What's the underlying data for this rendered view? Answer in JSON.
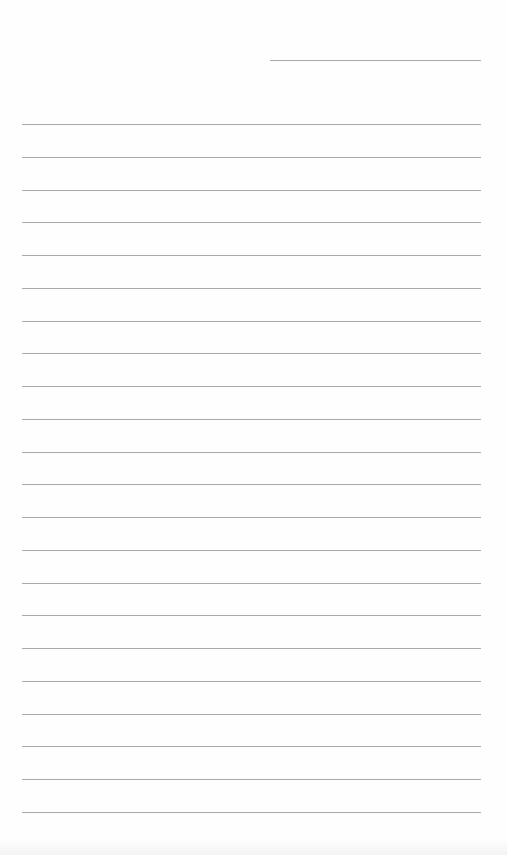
{
  "document": {
    "type": "lined-paper",
    "background_color": "#fefefe",
    "line_color": "#a9a9a9",
    "header_line": {
      "left": 270,
      "top": 60,
      "width": 211
    },
    "rules": {
      "count": 22,
      "left": 22,
      "width": 459,
      "first_top": 124,
      "spacing": 32.76
    }
  }
}
